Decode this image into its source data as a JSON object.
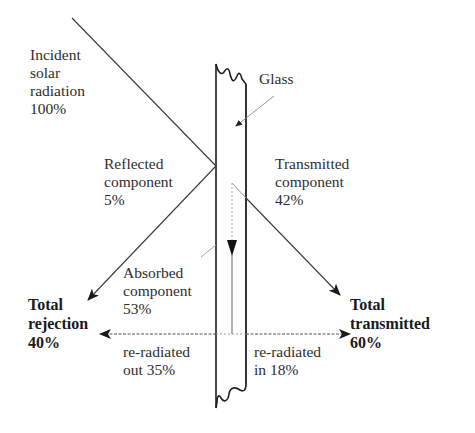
{
  "diagram": {
    "labels": {
      "incident": [
        "Incident",
        "solar",
        "radiation",
        "100%"
      ],
      "glass": "Glass",
      "reflected": [
        "Reflected",
        "component",
        "5%"
      ],
      "transmitted": [
        "Transmitted",
        "component",
        "42%"
      ],
      "absorbed": [
        "Absorbed",
        "component",
        "53%"
      ],
      "total_rejection": [
        "Total",
        "rejection",
        "40%"
      ],
      "total_transmitted": [
        "Total",
        "transmitted",
        "60%"
      ],
      "reradiated_out": [
        "re-radiated",
        "out 35%"
      ],
      "reradiated_in": [
        "re-radiated",
        "in 18%"
      ]
    },
    "values": {
      "incident_pct": 100,
      "reflected_pct": 5,
      "transmitted_pct": 42,
      "absorbed_pct": 53,
      "reradiated_out_pct": 35,
      "reradiated_in_pct": 18,
      "total_rejection_pct": 40,
      "total_transmitted_pct": 60
    },
    "colors": {
      "line": "#3a3a3a",
      "glass_edge": "#1e1e1e",
      "dashed": "#555555",
      "pointer": "#888888",
      "text": "#2e2e2e"
    }
  }
}
